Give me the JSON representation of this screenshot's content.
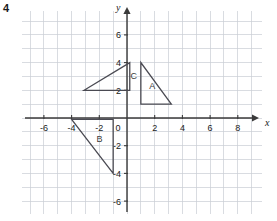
{
  "question_number": "4",
  "axes": {
    "x_label": "x",
    "y_label": "y",
    "x_ticks": [
      {
        "value": -6,
        "label": "-6"
      },
      {
        "value": -4,
        "label": "-4"
      },
      {
        "value": -2,
        "label": "-2"
      },
      {
        "value": 2,
        "label": "2"
      },
      {
        "value": 4,
        "label": "4"
      },
      {
        "value": 6,
        "label": "6"
      },
      {
        "value": 8,
        "label": "8"
      }
    ],
    "y_ticks": [
      {
        "value": 6,
        "label": "6"
      },
      {
        "value": 4,
        "label": "4"
      },
      {
        "value": 2,
        "label": "2"
      },
      {
        "value": -2,
        "label": "-2"
      },
      {
        "value": -4,
        "label": "-4"
      },
      {
        "value": -6,
        "label": "-6"
      }
    ],
    "origin_label": "0",
    "x_range": [
      -7.5,
      9.7
    ],
    "y_range": [
      -7.5,
      7.5
    ],
    "grid": true,
    "grid_color": "#c9cdd4",
    "axis_color": "#3a3a3a"
  },
  "chart_data": {
    "type": "scatter",
    "title": "",
    "xlabel": "x",
    "ylabel": "y",
    "xlim": [
      -7.5,
      9.7
    ],
    "ylim": [
      -7.5,
      7.5
    ],
    "grid": true,
    "shapes": [
      {
        "name": "A",
        "label": "A",
        "label_position": [
          1.6,
          2.1
        ],
        "vertices": [
          [
            1,
            4
          ],
          [
            1,
            1
          ],
          [
            3.2,
            1
          ]
        ],
        "closed": true,
        "stroke": "#4a4a52"
      },
      {
        "name": "B",
        "label": "B",
        "label_position": [
          -2.2,
          -1.7
        ],
        "vertices": [
          [
            -4,
            -0.1
          ],
          [
            -1,
            -0.1
          ],
          [
            -1,
            -4
          ]
        ],
        "closed": true,
        "stroke": "#4a4a52"
      },
      {
        "name": "C",
        "label": "C",
        "label_position": [
          0.25,
          2.85
        ],
        "vertices": [
          [
            0.2,
            4
          ],
          [
            -3.1,
            2
          ],
          [
            0.2,
            2
          ]
        ],
        "closed": true,
        "stroke": "#4a4a52"
      }
    ]
  }
}
